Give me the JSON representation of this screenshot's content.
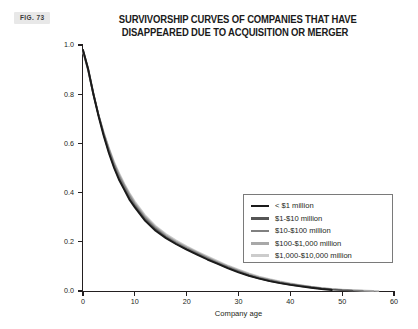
{
  "figure": {
    "badge": "FIG. 73"
  },
  "chart_data": {
    "type": "line",
    "title": "SURVIVORSHIP CURVES OF COMPANIES THAT HAVE DISAPPEARED DUE TO ACQUISITION OR MERGER",
    "title_line1": "SURVIVORSHIP CURVES OF COMPANIES THAT HAVE",
    "title_line2": "DISAPPEARED DUE TO ACQUISITION OR MERGER",
    "xlabel": "Company age",
    "ylabel": "Probability of survival",
    "xlim": [
      0,
      60
    ],
    "ylim": [
      0.0,
      1.0
    ],
    "xticks": [
      0,
      10,
      20,
      30,
      40,
      50,
      60
    ],
    "yticks": [
      "0.0",
      "0.2",
      "0.4",
      "0.6",
      "0.8",
      "1.0"
    ],
    "ytick_values": [
      0.0,
      0.2,
      0.4,
      0.6,
      0.8,
      1.0
    ],
    "grid": false,
    "legend_position": "center-right",
    "series": [
      {
        "name": "< $1 million",
        "color": "#1a1a1a",
        "x": [
          0,
          1,
          2,
          3,
          4,
          5,
          6,
          7,
          8,
          9,
          10,
          12,
          14,
          16,
          18,
          20,
          22,
          24,
          26,
          28,
          30,
          32,
          34,
          36,
          38,
          40,
          42,
          44,
          46,
          48
        ],
        "values": [
          0.98,
          0.9,
          0.8,
          0.71,
          0.63,
          0.56,
          0.5,
          0.45,
          0.41,
          0.37,
          0.34,
          0.285,
          0.245,
          0.215,
          0.19,
          0.168,
          0.148,
          0.128,
          0.11,
          0.092,
          0.076,
          0.062,
          0.05,
          0.04,
          0.032,
          0.025,
          0.019,
          0.013,
          0.008,
          0.004
        ]
      },
      {
        "name": "$1-$10 million",
        "color": "#555555",
        "x": [
          0,
          1,
          2,
          3,
          4,
          5,
          6,
          7,
          8,
          9,
          10,
          12,
          14,
          16,
          18,
          20,
          22,
          24,
          26,
          28,
          30,
          32,
          34,
          36,
          38,
          40,
          42,
          44,
          46,
          48,
          50,
          52
        ],
        "values": [
          0.98,
          0.905,
          0.805,
          0.715,
          0.635,
          0.565,
          0.505,
          0.455,
          0.415,
          0.375,
          0.345,
          0.29,
          0.25,
          0.218,
          0.192,
          0.17,
          0.15,
          0.13,
          0.112,
          0.094,
          0.078,
          0.063,
          0.051,
          0.041,
          0.033,
          0.026,
          0.02,
          0.015,
          0.01,
          0.006,
          0.003,
          0.001
        ]
      },
      {
        "name": "$10-$100 million",
        "color": "#808080",
        "x": [
          0,
          1,
          2,
          3,
          4,
          5,
          6,
          7,
          8,
          9,
          10,
          12,
          14,
          16,
          18,
          20,
          22,
          24,
          26,
          28,
          30,
          32,
          34,
          36,
          38,
          40,
          42,
          44,
          46,
          48,
          50,
          52,
          54
        ],
        "values": [
          0.975,
          0.9,
          0.8,
          0.715,
          0.64,
          0.575,
          0.515,
          0.465,
          0.425,
          0.385,
          0.352,
          0.296,
          0.255,
          0.222,
          0.196,
          0.174,
          0.154,
          0.134,
          0.115,
          0.097,
          0.081,
          0.066,
          0.054,
          0.044,
          0.035,
          0.028,
          0.022,
          0.016,
          0.011,
          0.007,
          0.004,
          0.002,
          0.001
        ]
      },
      {
        "name": "$100-$1,000 million",
        "color": "#a8a8a8",
        "x": [
          0,
          1,
          2,
          3,
          4,
          5,
          6,
          7,
          8,
          9,
          10,
          12,
          14,
          16,
          18,
          20,
          22,
          24,
          26,
          28,
          30,
          32,
          34,
          36,
          38,
          40,
          42,
          44,
          46,
          48,
          50,
          52,
          54,
          56
        ],
        "values": [
          0.975,
          0.895,
          0.8,
          0.715,
          0.642,
          0.578,
          0.52,
          0.472,
          0.43,
          0.392,
          0.358,
          0.302,
          0.26,
          0.227,
          0.2,
          0.178,
          0.157,
          0.137,
          0.118,
          0.1,
          0.084,
          0.069,
          0.056,
          0.046,
          0.037,
          0.029,
          0.023,
          0.017,
          0.012,
          0.008,
          0.005,
          0.003,
          0.0015,
          0.0005
        ]
      },
      {
        "name": "$1,000-$10,000 million",
        "color": "#cccccc",
        "x": [
          0,
          1,
          2,
          3,
          4,
          5,
          6,
          7,
          8,
          9,
          10,
          12,
          14,
          16,
          18,
          20,
          22,
          24,
          26,
          28,
          30,
          32,
          34,
          36,
          38,
          40,
          42,
          44,
          46,
          48,
          50,
          52,
          54,
          56,
          57
        ],
        "values": [
          0.97,
          0.895,
          0.8,
          0.718,
          0.645,
          0.582,
          0.525,
          0.478,
          0.435,
          0.398,
          0.364,
          0.308,
          0.265,
          0.232,
          0.205,
          0.182,
          0.161,
          0.141,
          0.122,
          0.103,
          0.087,
          0.072,
          0.059,
          0.048,
          0.039,
          0.031,
          0.024,
          0.018,
          0.013,
          0.009,
          0.006,
          0.004,
          0.002,
          0.001,
          0.0005
        ]
      }
    ]
  }
}
